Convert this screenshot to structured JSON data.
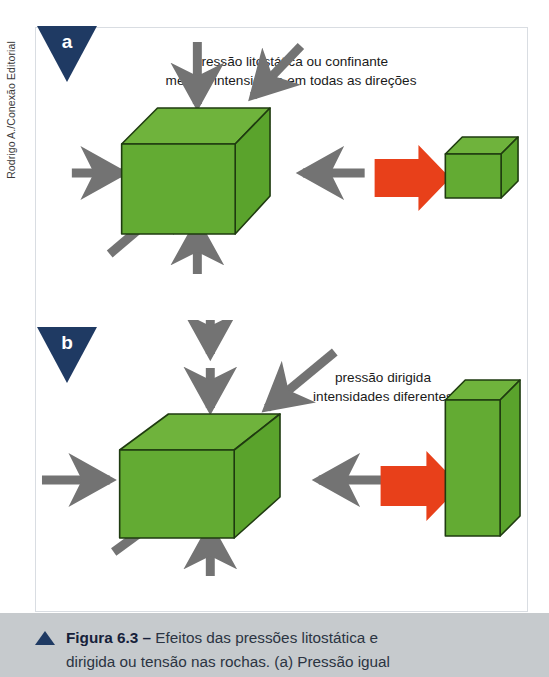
{
  "credit": "Rodrigo A./Conexão Editorial",
  "figure": {
    "panels": [
      {
        "letter": "a",
        "label_line1": "pressão litostática ou confinante",
        "label_line2": "mesma intensidade em todas as direções",
        "result_shape": "cubo-menor-uniforme"
      },
      {
        "letter": "b",
        "label_line1": "pressão dirigida",
        "label_line2": "intensidades diferentes",
        "result_shape": "prisma-alongado-deformado"
      }
    ]
  },
  "caption": {
    "bullet": "triangle-up-icon",
    "title": "Figura 6.3",
    "dash": "–",
    "line1_rest": " Efeitos das pressões litostática e",
    "line2": "dirigida ou tensão nas rochas. (a) Pressão igual"
  },
  "colors": {
    "cube_face": "#63ab33",
    "cube_top": "#6fb33c",
    "cube_side": "#5aa32c",
    "cube_outline": "#1f3b10",
    "arrow_gray": "#737373",
    "arrow_red": "#e8401a",
    "flag_navy": "#1f3a63",
    "caption_band": "#c6cacd",
    "frame_border": "#d9dde2"
  }
}
